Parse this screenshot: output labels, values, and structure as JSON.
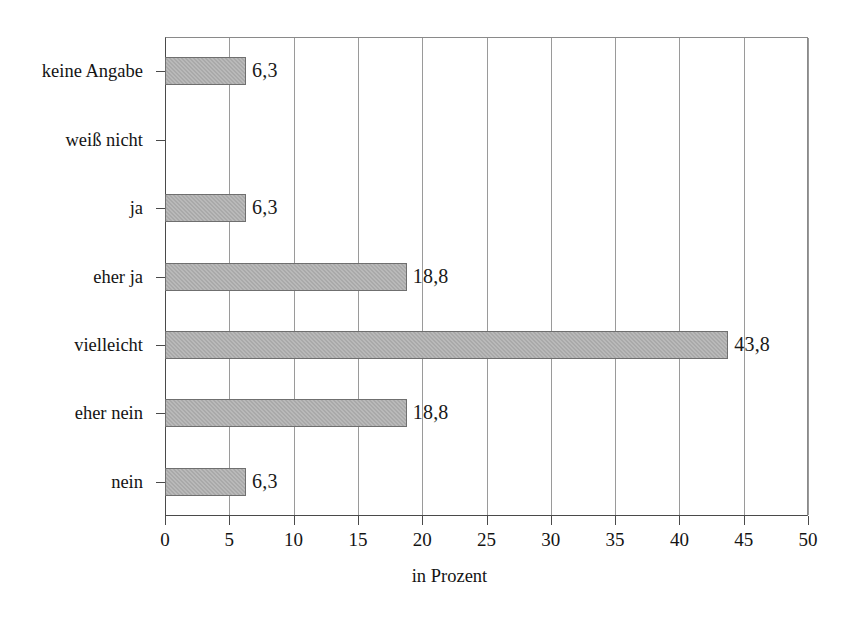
{
  "chart_data": {
    "type": "bar",
    "orientation": "horizontal",
    "title": "",
    "subtitle": "",
    "xlabel": "in Prozent",
    "ylabel": "",
    "categories": [
      "nein",
      "eher nein",
      "vielleicht",
      "eher ja",
      "ja",
      "weiß nicht",
      "keine Angabe"
    ],
    "values": [
      6.3,
      18.8,
      43.8,
      18.8,
      6.3,
      0,
      6.3
    ],
    "value_labels": [
      "6,3",
      "18,8",
      "43,8",
      "18,8",
      "6,3",
      "",
      "6,3"
    ],
    "xlim": [
      0,
      50
    ],
    "xticks": [
      0,
      5,
      10,
      15,
      20,
      25,
      30,
      35,
      40,
      45,
      50
    ],
    "xtick_labels": [
      "0",
      "5",
      "10",
      "15",
      "20",
      "25",
      "30",
      "35",
      "40",
      "45",
      "50"
    ],
    "grid": "vertical",
    "legend": "none",
    "bar_color": "#a9a9a9",
    "bar_edge_color": "#6f6f6f",
    "axis_color": "#4a4a4a",
    "grid_color": "#9a9a9a",
    "text_color": "#141414",
    "background": "#ffffff"
  }
}
